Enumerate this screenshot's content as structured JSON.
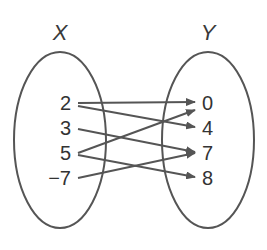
{
  "diagram": {
    "type": "mapping",
    "domain_label": "X",
    "range_label": "Y",
    "domain": [
      "2",
      "3",
      "5",
      "−7"
    ],
    "range": [
      "0",
      "4",
      "7",
      "8"
    ],
    "mappings": [
      {
        "from": "2",
        "to": "0"
      },
      {
        "from": "2",
        "to": "4"
      },
      {
        "from": "3",
        "to": "7"
      },
      {
        "from": "5",
        "to": "0"
      },
      {
        "from": "5",
        "to": "8"
      },
      {
        "from": "−7",
        "to": "7"
      }
    ],
    "colors": {
      "stroke": "#555555",
      "text": "#333333"
    }
  }
}
